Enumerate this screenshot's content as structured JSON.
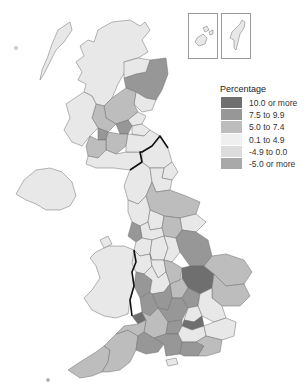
{
  "legend": {
    "title": "Percentage",
    "items": [
      {
        "label": "10.0 or more",
        "color": "#6f6f6f"
      },
      {
        "label": "7.5 to 9.9",
        "color": "#979797"
      },
      {
        "label": "5.0 to 7.4",
        "color": "#bdbdbd"
      },
      {
        "label": "0.1 to 4.9",
        "color": "#e8e8e8"
      },
      {
        "label": "-4.9 to 0.0",
        "color": "#dcdcdc"
      },
      {
        "label": "-5.0 or more",
        "color": "#a9a9a9"
      }
    ]
  },
  "map": {
    "description": "Choropleth map of United Kingdom regions shaded by percentage change",
    "insets": [
      "Orkney Islands",
      "Shetland Islands"
    ],
    "border_lines": [
      "Scotland-England border",
      "Wales-England border"
    ]
  }
}
